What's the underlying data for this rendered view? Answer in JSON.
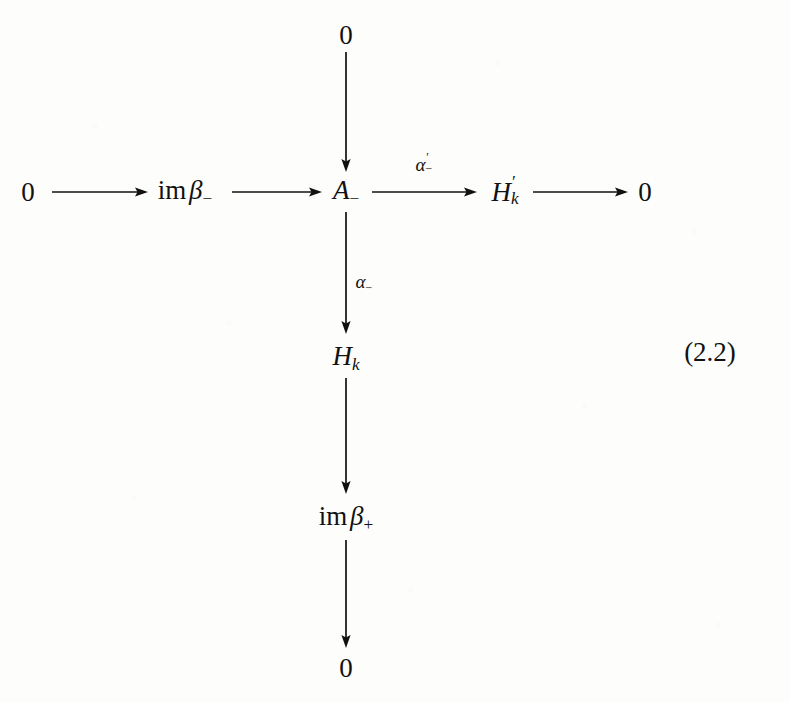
{
  "figure": {
    "kind": "commutative-diagram",
    "equation_number": "(2.2)",
    "ink_color": "#111111",
    "paper_color": "#fdfdfc"
  },
  "nodes": {
    "top_zero": {
      "text": "0",
      "x": 346,
      "y": 35
    },
    "left_zero": {
      "text": "0",
      "x": 28,
      "y": 192
    },
    "im_beta_minus": {
      "op": "im",
      "var": "β",
      "sub": "−",
      "x": 185,
      "y": 192
    },
    "a_minus": {
      "var": "A",
      "sub": "−",
      "x": 346,
      "y": 192
    },
    "h_prime_k": {
      "var": "H",
      "prime": "′",
      "sub": "k",
      "x": 505,
      "y": 192
    },
    "right_zero": {
      "text": "0",
      "x": 645,
      "y": 192
    },
    "h_k": {
      "var": "H",
      "sub": "k",
      "x": 346,
      "y": 358
    },
    "im_beta_plus": {
      "op": "im",
      "var": "β",
      "sub": "+",
      "x": 346,
      "y": 518
    },
    "bottom_zero": {
      "text": "0",
      "x": 346,
      "y": 668
    }
  },
  "arrow_labels": {
    "alpha_prime_minus": {
      "var": "α",
      "prime": "′",
      "sub": "−",
      "x": 424,
      "y": 164
    },
    "alpha_minus": {
      "var": "α",
      "sub": "−",
      "x": 364,
      "y": 283
    }
  },
  "arrows": [
    {
      "name": "arrow-zero-to-im-beta-minus",
      "from": "left_zero",
      "to": "im_beta_minus",
      "direction": "right"
    },
    {
      "name": "arrow-im-beta-minus-to-a-minus",
      "from": "im_beta_minus",
      "to": "a_minus",
      "direction": "right"
    },
    {
      "name": "arrow-a-minus-to-h-prime-k",
      "from": "a_minus",
      "to": "h_prime_k",
      "direction": "right",
      "label": "alpha_prime_minus"
    },
    {
      "name": "arrow-h-prime-k-to-zero",
      "from": "h_prime_k",
      "to": "right_zero",
      "direction": "right"
    },
    {
      "name": "arrow-zero-to-a-minus",
      "from": "top_zero",
      "to": "a_minus",
      "direction": "down"
    },
    {
      "name": "arrow-a-minus-to-h-k",
      "from": "a_minus",
      "to": "h_k",
      "direction": "down",
      "label": "alpha_minus"
    },
    {
      "name": "arrow-h-k-to-im-beta-plus",
      "from": "h_k",
      "to": "im_beta_plus",
      "direction": "down"
    },
    {
      "name": "arrow-im-beta-plus-to-zero",
      "from": "im_beta_plus",
      "to": "bottom_zero",
      "direction": "down"
    }
  ]
}
